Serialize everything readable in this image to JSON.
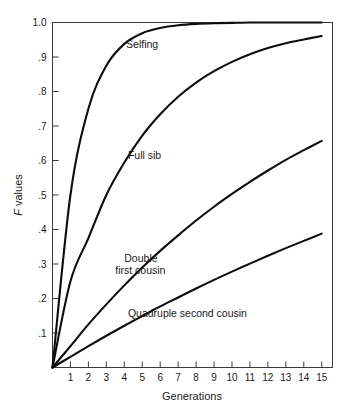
{
  "chart_data": {
    "type": "line",
    "title": "",
    "xlabel": "Generations",
    "ylabel": "F values",
    "ylabel_italic_prefix": "F",
    "ylabel_rest": " values",
    "xlim": [
      0,
      15.6
    ],
    "ylim": [
      0,
      1.0
    ],
    "grid": false,
    "legend": "inline-curve-labels",
    "x_ticks": [
      1,
      2,
      3,
      4,
      5,
      6,
      7,
      8,
      9,
      10,
      11,
      12,
      13,
      14,
      15
    ],
    "x_tick_labels": [
      "1",
      "2",
      "3",
      "4",
      "5",
      "6",
      "7",
      "8",
      "9",
      "10",
      "11",
      "12",
      "13",
      "14",
      "15"
    ],
    "y_ticks": [
      0.1,
      0.2,
      0.3,
      0.4,
      0.5,
      0.6,
      0.7,
      0.8,
      0.9,
      1.0
    ],
    "y_tick_labels": [
      ".1",
      ".2",
      ".3",
      ".4",
      ".5",
      ".6",
      ".7",
      ".8",
      ".9",
      "1.0"
    ],
    "x": [
      0,
      1,
      2,
      3,
      4,
      5,
      6,
      7,
      8,
      9,
      10,
      11,
      12,
      13,
      14,
      15
    ],
    "series": [
      {
        "name": "Selfing",
        "label": "Selfing",
        "color": "#0d0d0d",
        "label_x": 4.1,
        "label_y": 0.925,
        "values": [
          0.0,
          0.5,
          0.75,
          0.875,
          0.938,
          0.969,
          0.984,
          0.992,
          0.996,
          0.998,
          0.999,
          1.0,
          1.0,
          1.0,
          1.0,
          1.0
        ]
      },
      {
        "name": "Full sib",
        "label": "Full sib",
        "color": "#0d0d0d",
        "label_x": 4.2,
        "label_y": 0.605,
        "values": [
          0.0,
          0.25,
          0.375,
          0.5,
          0.594,
          0.672,
          0.734,
          0.785,
          0.826,
          0.859,
          0.886,
          0.908,
          0.926,
          0.94,
          0.951,
          0.961
        ]
      },
      {
        "name": "Double first cousin",
        "label_line1": "Double",
        "label_line2": "first cousin",
        "color": "#0d0d0d",
        "label_x": 4.0,
        "label_y": 0.305,
        "values": [
          0.0,
          0.062,
          0.125,
          0.183,
          0.238,
          0.29,
          0.338,
          0.383,
          0.426,
          0.466,
          0.503,
          0.538,
          0.571,
          0.602,
          0.63,
          0.657
        ]
      },
      {
        "name": "Quadruple second cousin",
        "label": "Quadruple second cousin",
        "color": "#0d0d0d",
        "label_x": 4.2,
        "label_y": 0.145,
        "values": [
          0.0,
          0.031,
          0.062,
          0.092,
          0.121,
          0.149,
          0.177,
          0.203,
          0.229,
          0.254,
          0.278,
          0.301,
          0.324,
          0.346,
          0.367,
          0.388
        ]
      }
    ]
  },
  "figure": {
    "background_color": "#ffffff",
    "axis_color": "#3a3a3a",
    "curve_color": "#0d0d0d"
  }
}
